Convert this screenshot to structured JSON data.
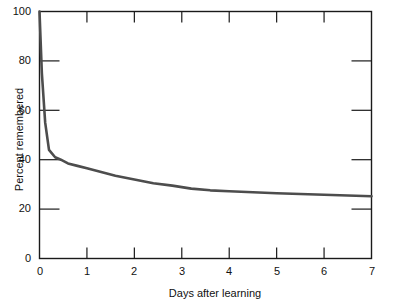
{
  "chart_data": {
    "type": "line",
    "title": "",
    "subtitle": "",
    "xlabel": "Days after learning",
    "ylabel": "Percent remembered",
    "xlim": [
      0,
      7
    ],
    "ylim": [
      0,
      100
    ],
    "grid": false,
    "legend": null,
    "legend_position": "none",
    "x_ticks": [
      0,
      1,
      2,
      3,
      4,
      5,
      6,
      7
    ],
    "x_tick_labels": [
      "0",
      "1",
      "2",
      "3",
      "4",
      "5",
      "6",
      "7"
    ],
    "y_ticks": [
      0,
      20,
      40,
      60,
      80,
      100
    ],
    "y_tick_labels": [
      "0",
      "20",
      "40",
      "60",
      "80",
      "100"
    ],
    "series": [
      {
        "name": "Retention",
        "color": "#4d4d4d",
        "x": [
          0.0,
          0.05,
          0.12,
          0.2,
          0.33,
          0.45,
          0.6,
          0.8,
          1.0,
          1.3,
          1.6,
          2.0,
          2.4,
          2.8,
          3.2,
          3.6,
          4.0,
          4.5,
          5.0,
          5.5,
          6.0,
          6.5,
          7.0
        ],
        "values": [
          100,
          75,
          55,
          44,
          41,
          40,
          38.5,
          37.5,
          36.5,
          35,
          33.5,
          32,
          30.5,
          29.5,
          28.3,
          27.6,
          27.2,
          26.8,
          26.4,
          26.1,
          25.8,
          25.5,
          25.2
        ]
      }
    ],
    "annotations": [],
    "axis_style": {
      "frame": "box",
      "tick_direction": "inward",
      "top_ticks_at": [
        1,
        2,
        3,
        4,
        5,
        6
      ],
      "right_ticks_at": [
        20,
        40,
        60,
        80
      ],
      "left_ticks_at": [
        20,
        40,
        60,
        80
      ],
      "bottom_ticks_at": [
        1,
        2,
        3,
        4,
        5,
        6
      ],
      "axis_color": "#1a1a1a",
      "line_color": "#4d4d4d",
      "background": "#ffffff"
    }
  }
}
